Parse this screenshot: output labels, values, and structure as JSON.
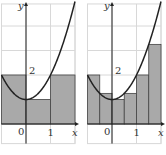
{
  "function": "y = x^2 + 1",
  "panels": [
    {
      "name": "left",
      "interval": [
        -1,
        2
      ],
      "n": 3,
      "rect_heights": [
        2,
        1,
        2
      ],
      "labels": {
        "y_axis": "y",
        "x_axis": "x",
        "origin": "0",
        "x_tick": "1",
        "y_tick": "2"
      }
    },
    {
      "name": "right",
      "interval": [
        -1,
        2
      ],
      "n": 6,
      "rect_heights": [
        2,
        1.25,
        1,
        1.25,
        2,
        3.25
      ],
      "labels": {
        "y_axis": "y",
        "x_axis": "x",
        "origin": "0",
        "x_tick": "1",
        "y_tick": "2"
      }
    }
  ],
  "colors": {
    "fill": "#a9a9a9",
    "grid": "#d8d8d8",
    "curve": "#222222"
  }
}
